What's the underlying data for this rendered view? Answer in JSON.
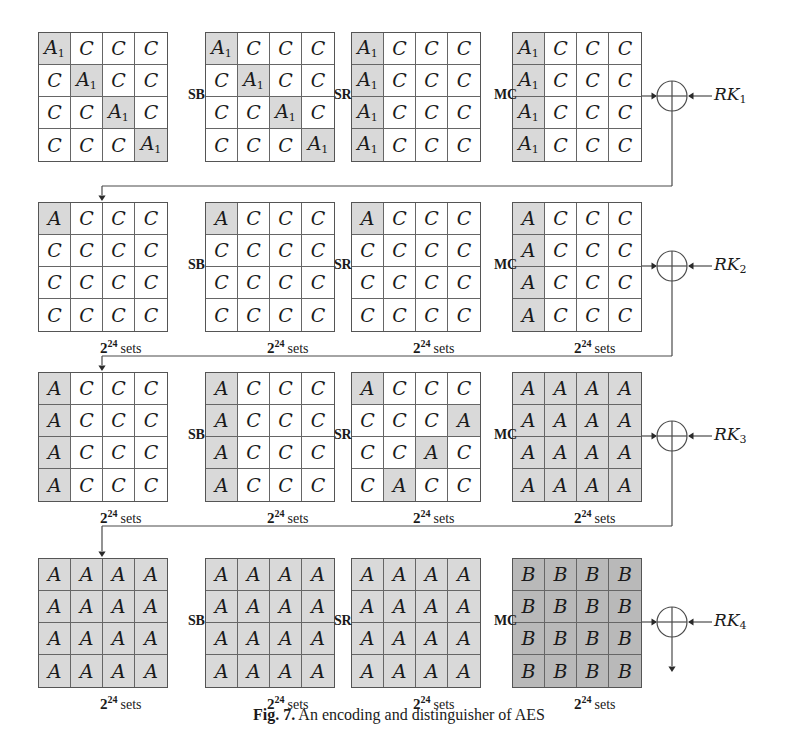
{
  "figure": {
    "caption_label": "Fig. 7.",
    "caption_text": "An encoding and distinguisher of AES"
  },
  "symbols": {
    "active_indexed": "A",
    "active_indexed_sub": "1",
    "active": "A",
    "constant": "C",
    "balanced": "B"
  },
  "shading": {
    "none": "#ffffff",
    "light": "#d9d9d9",
    "dark": "#b9b9b9",
    "line": "#4a4a4a"
  },
  "operations": {
    "sub_bytes": "SB",
    "shift_rows": "SR",
    "mix_columns": "MC"
  },
  "sets_label": {
    "base": "2",
    "exponent": "24",
    "word": "sets"
  },
  "round_keys": [
    {
      "name": "RK",
      "sub": "1"
    },
    {
      "name": "RK",
      "sub": "2"
    },
    {
      "name": "RK",
      "sub": "3"
    },
    {
      "name": "RK",
      "sub": "4"
    }
  ],
  "rounds": [
    {
      "index": 1,
      "round_key": "RK1",
      "show_sets_labels": false,
      "states": [
        {
          "stage": "input",
          "cells": [
            [
              "A1",
              "C",
              "C",
              "C"
            ],
            [
              "C",
              "A1",
              "C",
              "C"
            ],
            [
              "C",
              "C",
              "A1",
              "C"
            ],
            [
              "C",
              "C",
              "C",
              "A1"
            ]
          ],
          "shade": [
            [
              "light",
              "none",
              "none",
              "none"
            ],
            [
              "none",
              "light",
              "none",
              "none"
            ],
            [
              "none",
              "none",
              "light",
              "none"
            ],
            [
              "none",
              "none",
              "none",
              "light"
            ]
          ]
        },
        {
          "stage": "after-SB",
          "cells": [
            [
              "A1",
              "C",
              "C",
              "C"
            ],
            [
              "C",
              "A1",
              "C",
              "C"
            ],
            [
              "C",
              "C",
              "A1",
              "C"
            ],
            [
              "C",
              "C",
              "C",
              "A1"
            ]
          ],
          "shade": [
            [
              "light",
              "none",
              "none",
              "none"
            ],
            [
              "none",
              "light",
              "none",
              "none"
            ],
            [
              "none",
              "none",
              "light",
              "none"
            ],
            [
              "none",
              "none",
              "none",
              "light"
            ]
          ]
        },
        {
          "stage": "after-SR",
          "cells": [
            [
              "A1",
              "C",
              "C",
              "C"
            ],
            [
              "A1",
              "C",
              "C",
              "C"
            ],
            [
              "A1",
              "C",
              "C",
              "C"
            ],
            [
              "A1",
              "C",
              "C",
              "C"
            ]
          ],
          "shade": [
            [
              "light",
              "none",
              "none",
              "none"
            ],
            [
              "light",
              "none",
              "none",
              "none"
            ],
            [
              "light",
              "none",
              "none",
              "none"
            ],
            [
              "light",
              "none",
              "none",
              "none"
            ]
          ]
        },
        {
          "stage": "after-MC",
          "cells": [
            [
              "A1",
              "C",
              "C",
              "C"
            ],
            [
              "A1",
              "C",
              "C",
              "C"
            ],
            [
              "A1",
              "C",
              "C",
              "C"
            ],
            [
              "A1",
              "C",
              "C",
              "C"
            ]
          ],
          "shade": [
            [
              "light",
              "none",
              "none",
              "none"
            ],
            [
              "light",
              "none",
              "none",
              "none"
            ],
            [
              "light",
              "none",
              "none",
              "none"
            ],
            [
              "light",
              "none",
              "none",
              "none"
            ]
          ]
        }
      ]
    },
    {
      "index": 2,
      "round_key": "RK2",
      "show_sets_labels": true,
      "states": [
        {
          "stage": "input",
          "cells": [
            [
              "A",
              "C",
              "C",
              "C"
            ],
            [
              "C",
              "C",
              "C",
              "C"
            ],
            [
              "C",
              "C",
              "C",
              "C"
            ],
            [
              "C",
              "C",
              "C",
              "C"
            ]
          ],
          "shade": [
            [
              "light",
              "none",
              "none",
              "none"
            ],
            [
              "none",
              "none",
              "none",
              "none"
            ],
            [
              "none",
              "none",
              "none",
              "none"
            ],
            [
              "none",
              "none",
              "none",
              "none"
            ]
          ]
        },
        {
          "stage": "after-SB",
          "cells": [
            [
              "A",
              "C",
              "C",
              "C"
            ],
            [
              "C",
              "C",
              "C",
              "C"
            ],
            [
              "C",
              "C",
              "C",
              "C"
            ],
            [
              "C",
              "C",
              "C",
              "C"
            ]
          ],
          "shade": [
            [
              "light",
              "none",
              "none",
              "none"
            ],
            [
              "none",
              "none",
              "none",
              "none"
            ],
            [
              "none",
              "none",
              "none",
              "none"
            ],
            [
              "none",
              "none",
              "none",
              "none"
            ]
          ]
        },
        {
          "stage": "after-SR",
          "cells": [
            [
              "A",
              "C",
              "C",
              "C"
            ],
            [
              "C",
              "C",
              "C",
              "C"
            ],
            [
              "C",
              "C",
              "C",
              "C"
            ],
            [
              "C",
              "C",
              "C",
              "C"
            ]
          ],
          "shade": [
            [
              "light",
              "none",
              "none",
              "none"
            ],
            [
              "none",
              "none",
              "none",
              "none"
            ],
            [
              "none",
              "none",
              "none",
              "none"
            ],
            [
              "none",
              "none",
              "none",
              "none"
            ]
          ]
        },
        {
          "stage": "after-MC",
          "cells": [
            [
              "A",
              "C",
              "C",
              "C"
            ],
            [
              "A",
              "C",
              "C",
              "C"
            ],
            [
              "A",
              "C",
              "C",
              "C"
            ],
            [
              "A",
              "C",
              "C",
              "C"
            ]
          ],
          "shade": [
            [
              "light",
              "none",
              "none",
              "none"
            ],
            [
              "light",
              "none",
              "none",
              "none"
            ],
            [
              "light",
              "none",
              "none",
              "none"
            ],
            [
              "light",
              "none",
              "none",
              "none"
            ]
          ]
        }
      ]
    },
    {
      "index": 3,
      "round_key": "RK3",
      "show_sets_labels": true,
      "states": [
        {
          "stage": "input",
          "cells": [
            [
              "A",
              "C",
              "C",
              "C"
            ],
            [
              "A",
              "C",
              "C",
              "C"
            ],
            [
              "A",
              "C",
              "C",
              "C"
            ],
            [
              "A",
              "C",
              "C",
              "C"
            ]
          ],
          "shade": [
            [
              "light",
              "none",
              "none",
              "none"
            ],
            [
              "light",
              "none",
              "none",
              "none"
            ],
            [
              "light",
              "none",
              "none",
              "none"
            ],
            [
              "light",
              "none",
              "none",
              "none"
            ]
          ]
        },
        {
          "stage": "after-SB",
          "cells": [
            [
              "A",
              "C",
              "C",
              "C"
            ],
            [
              "A",
              "C",
              "C",
              "C"
            ],
            [
              "A",
              "C",
              "C",
              "C"
            ],
            [
              "A",
              "C",
              "C",
              "C"
            ]
          ],
          "shade": [
            [
              "light",
              "none",
              "none",
              "none"
            ],
            [
              "light",
              "none",
              "none",
              "none"
            ],
            [
              "light",
              "none",
              "none",
              "none"
            ],
            [
              "light",
              "none",
              "none",
              "none"
            ]
          ]
        },
        {
          "stage": "after-SR",
          "cells": [
            [
              "A",
              "C",
              "C",
              "C"
            ],
            [
              "C",
              "C",
              "C",
              "A"
            ],
            [
              "C",
              "C",
              "A",
              "C"
            ],
            [
              "C",
              "A",
              "C",
              "C"
            ]
          ],
          "shade": [
            [
              "light",
              "none",
              "none",
              "none"
            ],
            [
              "none",
              "none",
              "none",
              "light"
            ],
            [
              "none",
              "none",
              "light",
              "none"
            ],
            [
              "none",
              "light",
              "none",
              "none"
            ]
          ]
        },
        {
          "stage": "after-MC",
          "cells": [
            [
              "A",
              "A",
              "A",
              "A"
            ],
            [
              "A",
              "A",
              "A",
              "A"
            ],
            [
              "A",
              "A",
              "A",
              "A"
            ],
            [
              "A",
              "A",
              "A",
              "A"
            ]
          ],
          "shade": [
            [
              "light",
              "light",
              "light",
              "light"
            ],
            [
              "light",
              "light",
              "light",
              "light"
            ],
            [
              "light",
              "light",
              "light",
              "light"
            ],
            [
              "light",
              "light",
              "light",
              "light"
            ]
          ]
        }
      ]
    },
    {
      "index": 4,
      "round_key": "RK4",
      "show_sets_labels": true,
      "states": [
        {
          "stage": "input",
          "cells": [
            [
              "A",
              "A",
              "A",
              "A"
            ],
            [
              "A",
              "A",
              "A",
              "A"
            ],
            [
              "A",
              "A",
              "A",
              "A"
            ],
            [
              "A",
              "A",
              "A",
              "A"
            ]
          ],
          "shade": [
            [
              "light",
              "light",
              "light",
              "light"
            ],
            [
              "light",
              "light",
              "light",
              "light"
            ],
            [
              "light",
              "light",
              "light",
              "light"
            ],
            [
              "light",
              "light",
              "light",
              "light"
            ]
          ]
        },
        {
          "stage": "after-SB",
          "cells": [
            [
              "A",
              "A",
              "A",
              "A"
            ],
            [
              "A",
              "A",
              "A",
              "A"
            ],
            [
              "A",
              "A",
              "A",
              "A"
            ],
            [
              "A",
              "A",
              "A",
              "A"
            ]
          ],
          "shade": [
            [
              "light",
              "light",
              "light",
              "light"
            ],
            [
              "light",
              "light",
              "light",
              "light"
            ],
            [
              "light",
              "light",
              "light",
              "light"
            ],
            [
              "light",
              "light",
              "light",
              "light"
            ]
          ]
        },
        {
          "stage": "after-SR",
          "cells": [
            [
              "A",
              "A",
              "A",
              "A"
            ],
            [
              "A",
              "A",
              "A",
              "A"
            ],
            [
              "A",
              "A",
              "A",
              "A"
            ],
            [
              "A",
              "A",
              "A",
              "A"
            ]
          ],
          "shade": [
            [
              "light",
              "light",
              "light",
              "light"
            ],
            [
              "light",
              "light",
              "light",
              "light"
            ],
            [
              "light",
              "light",
              "light",
              "light"
            ],
            [
              "light",
              "light",
              "light",
              "light"
            ]
          ]
        },
        {
          "stage": "after-MC",
          "cells": [
            [
              "B",
              "B",
              "B",
              "B"
            ],
            [
              "B",
              "B",
              "B",
              "B"
            ],
            [
              "B",
              "B",
              "B",
              "B"
            ],
            [
              "B",
              "B",
              "B",
              "B"
            ]
          ],
          "shade": [
            [
              "dark",
              "dark",
              "dark",
              "dark"
            ],
            [
              "dark",
              "dark",
              "dark",
              "dark"
            ],
            [
              "dark",
              "dark",
              "dark",
              "dark"
            ],
            [
              "dark",
              "dark",
              "dark",
              "dark"
            ]
          ]
        }
      ]
    }
  ]
}
